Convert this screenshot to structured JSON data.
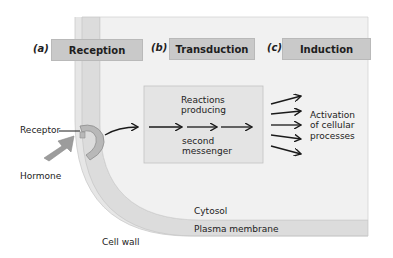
{
  "diagram": {
    "type": "signal-transduction-pathway",
    "stages": [
      {
        "letter": "(a)",
        "label": "Reception"
      },
      {
        "letter": "(b)",
        "label": "Transduction"
      },
      {
        "letter": "(c)",
        "label": "Induction"
      }
    ],
    "transduction_box": {
      "line1": "Reactions",
      "line2": "producing",
      "line3": "second",
      "line4": "messenger"
    },
    "induction_text": {
      "line1": "Activation",
      "line2": "of cellular",
      "line3": "processes"
    },
    "labels": {
      "receptor": "Receptor",
      "hormone": "Hormone",
      "cytosol": "Cytosol",
      "plasma_membrane": "Plasma membrane",
      "cell_wall": "Cell wall"
    },
    "colors": {
      "cell_wall": "#e3e3e3",
      "cytosol": "#f2f2f2",
      "membrane": "#d8d8d8",
      "stage_bar": "#c9c9c9",
      "box": "#e6e6e6",
      "receptor": "#b8b8b8",
      "hormone": "#9c9c9c",
      "arrow": "#1a1a1a"
    }
  }
}
